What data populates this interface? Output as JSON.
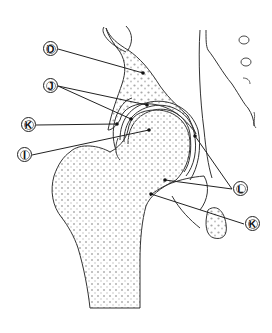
{
  "diagram": {
    "colors": {
      "outline": "#333333",
      "leader": "#222222",
      "stipple": "#9a9a9a",
      "background": "#ffffff"
    },
    "labels": [
      {
        "id": "D",
        "text": "D",
        "x": 50,
        "y": 49,
        "target": [
          121,
          72
        ]
      },
      {
        "id": "J",
        "text": "J",
        "x": 50,
        "y": 86,
        "targets": [
          [
            147,
            105
          ],
          [
            131,
            119
          ]
        ]
      },
      {
        "id": "K1",
        "text": "K",
        "x": 28,
        "y": 125,
        "target": [
          117,
          124
        ]
      },
      {
        "id": "I",
        "text": "I",
        "x": 24,
        "y": 155,
        "target": [
          149,
          130
        ]
      },
      {
        "id": "L",
        "text": "L",
        "x": 240,
        "y": 189,
        "targets": [
          [
            196,
            136
          ],
          [
            165,
            180
          ]
        ]
      },
      {
        "id": "K2",
        "text": "K",
        "x": 252,
        "y": 224,
        "target": [
          151,
          194
        ]
      }
    ]
  }
}
